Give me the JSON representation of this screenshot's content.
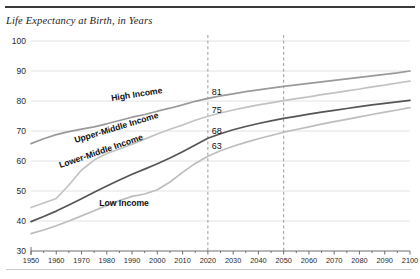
{
  "header": {
    "title": "Life Expectancy at Birth, in Years"
  },
  "axes": {
    "y_ticks": [
      "100",
      "90",
      "80",
      "70",
      "60",
      "50",
      "40",
      "30"
    ],
    "x_ticks": [
      "1950",
      "1960",
      "1970",
      "1980",
      "1990",
      "2000",
      "2010",
      "2020",
      "2030",
      "2040",
      "2050",
      "2060",
      "2070",
      "2080",
      "2090",
      "2100"
    ]
  },
  "series_labels": {
    "high": "High Income",
    "upper_middle": "Upper-Middle Income",
    "lower_middle": "Lower-Middle Income",
    "low": "Low Income"
  },
  "value_labels": {
    "high": "81",
    "upper_middle": "75",
    "lower_middle": "68",
    "low": "63"
  },
  "colors": {
    "high_income_line": "#9a9a9a",
    "upper_middle_line": "#c2c2c2",
    "lower_middle_line": "#555555",
    "low_income_line": "#bdbdbd",
    "gridline": "#e2e2e2",
    "axis": "#6f6f6f",
    "marker_line": "#9b9b9b",
    "rule_top": "#3a3a3a",
    "rule_bottom": "#c9c9c9"
  },
  "chart_data": {
    "type": "line",
    "title": "Life Expectancy at Birth, in Years",
    "xlabel": "",
    "ylabel": "",
    "xlim": [
      1950,
      2100
    ],
    "ylim": [
      30,
      100
    ],
    "grid": true,
    "legend": "inline-labels",
    "annotations": [
      {
        "type": "vline",
        "x": 2020,
        "style": "dashed"
      },
      {
        "type": "vline",
        "x": 2050,
        "style": "dashed"
      },
      {
        "type": "point-label",
        "x": 2020,
        "y": 81,
        "text": "81",
        "series": "High Income"
      },
      {
        "type": "point-label",
        "x": 2020,
        "y": 75,
        "text": "75",
        "series": "Upper-Middle Income"
      },
      {
        "type": "point-label",
        "x": 2020,
        "y": 68,
        "text": "68",
        "series": "Lower-Middle Income"
      },
      {
        "type": "point-label",
        "x": 2020,
        "y": 63,
        "text": "63",
        "series": "Low Income"
      }
    ],
    "x": [
      1950,
      1955,
      1960,
      1965,
      1970,
      1975,
      1980,
      1985,
      1990,
      1995,
      2000,
      2005,
      2010,
      2015,
      2020,
      2025,
      2030,
      2035,
      2040,
      2045,
      2050,
      2055,
      2060,
      2065,
      2070,
      2075,
      2080,
      2085,
      2090,
      2095,
      2100
    ],
    "series": [
      {
        "name": "High Income",
        "color": "#9a9a9a",
        "values": [
          65.8,
          67.4,
          68.8,
          69.8,
          70.6,
          71.4,
          72.4,
          73.5,
          74.6,
          75.5,
          76.6,
          77.6,
          78.7,
          79.9,
          80.9,
          81.7,
          82.4,
          83.1,
          83.7,
          84.3,
          84.9,
          85.4,
          85.9,
          86.4,
          86.9,
          87.4,
          87.9,
          88.4,
          88.9,
          89.4,
          90.0
        ]
      },
      {
        "name": "Upper-Middle Income",
        "color": "#c2c2c2",
        "values": [
          44.5,
          46.0,
          47.5,
          52.0,
          57.0,
          60.3,
          62.5,
          64.0,
          65.6,
          67.3,
          69.0,
          70.6,
          72.0,
          73.6,
          74.9,
          76.0,
          77.0,
          77.9,
          78.7,
          79.4,
          80.1,
          80.8,
          81.4,
          82.1,
          82.7,
          83.4,
          84.0,
          84.7,
          85.3,
          86.0,
          86.6
        ]
      },
      {
        "name": "Lower-Middle Income",
        "color": "#555555",
        "values": [
          39.8,
          41.5,
          43.3,
          45.3,
          47.4,
          49.6,
          51.7,
          53.7,
          55.6,
          57.3,
          59.1,
          61.0,
          63.1,
          65.3,
          67.6,
          69.1,
          70.4,
          71.5,
          72.5,
          73.4,
          74.2,
          74.9,
          75.6,
          76.3,
          76.9,
          77.5,
          78.1,
          78.7,
          79.2,
          79.7,
          80.2
        ]
      },
      {
        "name": "Low Income",
        "color": "#bdbdbd",
        "values": [
          35.8,
          37.0,
          38.4,
          40.0,
          41.7,
          43.4,
          45.2,
          46.8,
          48.2,
          49.0,
          50.4,
          53.0,
          56.2,
          59.2,
          61.6,
          63.4,
          64.9,
          66.2,
          67.4,
          68.5,
          69.6,
          70.5,
          71.4,
          72.3,
          73.1,
          73.9,
          74.7,
          75.5,
          76.3,
          77.0,
          77.8
        ]
      }
    ]
  }
}
